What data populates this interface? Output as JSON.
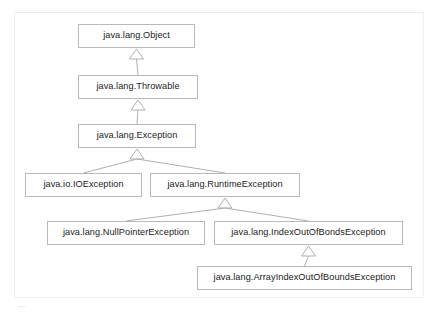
{
  "figure": {
    "kind": "uml-class-hierarchy-diagram",
    "relation_label": "generalization (extends)",
    "colors": {
      "canvas": "#ffffff",
      "node_fill": "#ffffff",
      "node_border": "#b9b9b9",
      "node_text": "#1b1b1b",
      "edge": "#b0b0b0",
      "frame": "#f0f0f0"
    },
    "caption_fragment": "...",
    "nodes": [
      {
        "id": "object",
        "label": "java.lang.Object",
        "x": 78,
        "y": 24,
        "w": 117,
        "h": 24
      },
      {
        "id": "throwable",
        "label": "java.lang.Throwable",
        "x": 78,
        "y": 75,
        "w": 120,
        "h": 24
      },
      {
        "id": "exception",
        "label": "java.lang.Exception",
        "x": 78,
        "y": 124,
        "w": 118,
        "h": 24
      },
      {
        "id": "ioexc",
        "label": "java.io.IOException",
        "x": 25,
        "y": 173,
        "w": 117,
        "h": 24
      },
      {
        "id": "runtime",
        "label": "java.lang.RuntimeException",
        "x": 150,
        "y": 173,
        "w": 150,
        "h": 24
      },
      {
        "id": "npe",
        "label": "java.lang.NullPointerException",
        "x": 47,
        "y": 221,
        "w": 158,
        "h": 24
      },
      {
        "id": "ioobe",
        "label": "java.lang.IndexOutOfBondsException",
        "x": 214,
        "y": 221,
        "w": 189,
        "h": 24
      },
      {
        "id": "aioobe",
        "label": "java.lang.ArrayIndexOutOfBoundsException",
        "x": 197,
        "y": 266,
        "w": 215,
        "h": 24
      }
    ],
    "edges": [
      {
        "from": "throwable",
        "to": "object"
      },
      {
        "from": "exception",
        "to": "throwable"
      },
      {
        "from": "ioexc",
        "to": "exception"
      },
      {
        "from": "runtime",
        "to": "exception"
      },
      {
        "from": "npe",
        "to": "runtime"
      },
      {
        "from": "ioobe",
        "to": "runtime"
      },
      {
        "from": "aioobe",
        "to": "ioobe"
      }
    ]
  }
}
